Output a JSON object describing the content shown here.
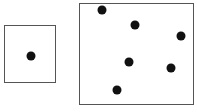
{
  "diagram": {
    "colors": {
      "border": "#555555",
      "dot": "#111111",
      "background": "#ffffff"
    },
    "boxes": [
      {
        "name": "small-box",
        "x": 4,
        "y": 25,
        "width": 52,
        "height": 58,
        "dot_count": 1,
        "dots": [
          {
            "x": 31,
            "y": 56
          }
        ]
      },
      {
        "name": "large-box",
        "x": 79,
        "y": 3,
        "width": 115,
        "height": 102,
        "dot_count": 6,
        "dots": [
          {
            "x": 102,
            "y": 10
          },
          {
            "x": 135,
            "y": 25
          },
          {
            "x": 181,
            "y": 36
          },
          {
            "x": 129,
            "y": 62
          },
          {
            "x": 171,
            "y": 68
          },
          {
            "x": 117,
            "y": 90
          }
        ]
      }
    ]
  }
}
